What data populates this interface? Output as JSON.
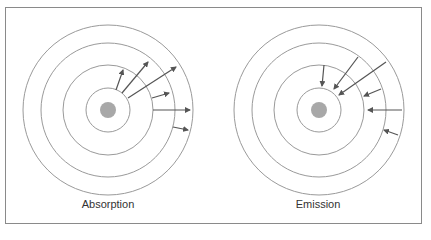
{
  "panels": [
    {
      "label": "Absorption",
      "direction": "outward"
    },
    {
      "label": "Emission",
      "direction": "inward"
    }
  ],
  "colors": {
    "orbit": "#9a9a9a",
    "nucleus": "#a8a8a8",
    "arrow": "#555555",
    "frame": "#8a8a8a"
  }
}
